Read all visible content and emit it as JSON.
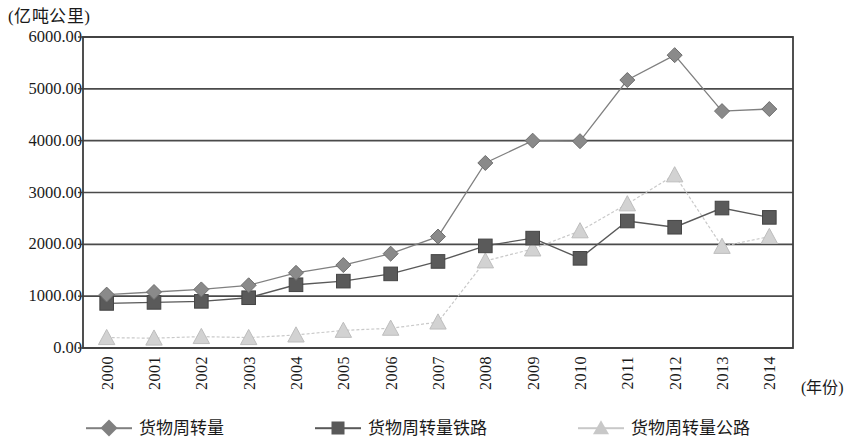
{
  "axes": {
    "y_unit_label": "(亿吨公里)",
    "x_axis_title": "(年份)",
    "y_ticks": [
      "0.00",
      "1000.00",
      "2000.00",
      "3000.00",
      "4000.00",
      "5000.00",
      "6000.00"
    ],
    "x_ticks": [
      "2000",
      "2001",
      "2002",
      "2003",
      "2004",
      "2005",
      "2006",
      "2007",
      "2008",
      "2009",
      "2010",
      "2011",
      "2012",
      "2013",
      "2014"
    ]
  },
  "legend": {
    "items": [
      {
        "label": "货物周转量",
        "marker": "diamond-marker",
        "color": "#808080"
      },
      {
        "label": "货物周转量铁路",
        "marker": "square-marker",
        "color": "#595959"
      },
      {
        "label": "货物周转量公路",
        "marker": "triangle-marker",
        "color": "#c8c8c8"
      }
    ]
  },
  "colors": {
    "frame": "#3d3d3d",
    "gridline": "#4a4a4a",
    "series_total": "#808080",
    "series_rail": "#595959",
    "series_road": "#c9c9c9",
    "background": "#ffffff"
  },
  "chart_data": {
    "type": "line",
    "title": "",
    "xlabel": "(年份)",
    "ylabel": "(亿吨公里)",
    "ylim": [
      0,
      6000
    ],
    "ytick_step": 1000,
    "grid": true,
    "legend_position": "bottom",
    "x": [
      "2000",
      "2001",
      "2002",
      "2003",
      "2004",
      "2005",
      "2006",
      "2007",
      "2008",
      "2009",
      "2010",
      "2011",
      "2012",
      "2013",
      "2014"
    ],
    "series": [
      {
        "name": "货物周转量",
        "marker": "diamond",
        "values": [
          1030,
          1080,
          1130,
          1210,
          1450,
          1600,
          1820,
          2150,
          3570,
          4000,
          3990,
          5170,
          5650,
          4570,
          4610
        ]
      },
      {
        "name": "货物周转量铁路",
        "marker": "square",
        "values": [
          860,
          880,
          900,
          970,
          1220,
          1290,
          1430,
          1670,
          1970,
          2120,
          1730,
          2450,
          2330,
          2700,
          2520
        ]
      },
      {
        "name": "货物周转量公路",
        "marker": "triangle",
        "values": [
          200,
          190,
          220,
          200,
          250,
          340,
          380,
          500,
          1680,
          1910,
          2260,
          2780,
          3340,
          1960,
          2150
        ]
      }
    ]
  }
}
